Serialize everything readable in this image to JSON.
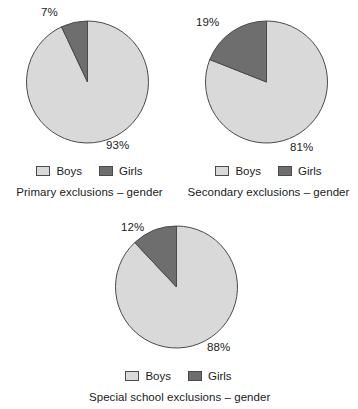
{
  "colors": {
    "boys": "#d9d9d9",
    "girls": "#6e6e6e",
    "outline": "#4a4a4a",
    "background": "#ffffff",
    "text": "#1b1b1b"
  },
  "legend": {
    "boys_label": "Boys",
    "girls_label": "Girls"
  },
  "charts": [
    {
      "id": "primary",
      "caption": "Primary exclusions – gender",
      "boys_label": "93%",
      "girls_label": "7%",
      "boys_value": 93,
      "girls_value": 7
    },
    {
      "id": "secondary",
      "caption": "Secondary exclusions – gender",
      "boys_label": "81%",
      "girls_label": "19%",
      "boys_value": 81,
      "girls_value": 19
    },
    {
      "id": "special",
      "caption": "Special school exclusions – gender",
      "boys_label": "88%",
      "girls_label": "12%",
      "boys_value": 88,
      "girls_value": 12
    }
  ],
  "chart_data": [
    {
      "type": "pie",
      "title": "Primary exclusions – gender",
      "categories": [
        "Boys",
        "Girls"
      ],
      "values": [
        93,
        7
      ],
      "data_labels": [
        "93%",
        "7%"
      ],
      "colors": [
        "#d9d9d9",
        "#6e6e6e"
      ],
      "legend_position": "bottom",
      "start_angle_deg": 0,
      "direction": "counterclockwise-girls"
    },
    {
      "type": "pie",
      "title": "Secondary exclusions – gender",
      "categories": [
        "Boys",
        "Girls"
      ],
      "values": [
        81,
        19
      ],
      "data_labels": [
        "81%",
        "19%"
      ],
      "colors": [
        "#d9d9d9",
        "#6e6e6e"
      ],
      "legend_position": "bottom",
      "start_angle_deg": 0,
      "direction": "counterclockwise-girls"
    },
    {
      "type": "pie",
      "title": "Special school exclusions – gender",
      "categories": [
        "Boys",
        "Girls"
      ],
      "values": [
        88,
        12
      ],
      "data_labels": [
        "88%",
        "12%"
      ],
      "colors": [
        "#d9d9d9",
        "#6e6e6e"
      ],
      "legend_position": "bottom",
      "start_angle_deg": 0,
      "direction": "counterclockwise-girls"
    }
  ]
}
